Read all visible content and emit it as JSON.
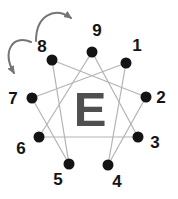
{
  "diagram": {
    "type": "enneagram",
    "center_letter": "E",
    "points": {
      "p1": {
        "label": "1"
      },
      "p2": {
        "label": "2"
      },
      "p3": {
        "label": "3"
      },
      "p4": {
        "label": "4"
      },
      "p5": {
        "label": "5"
      },
      "p6": {
        "label": "6"
      },
      "p7": {
        "label": "7"
      },
      "p8": {
        "label": "8"
      },
      "p9": {
        "label": "9"
      }
    },
    "connections": [
      "9-3",
      "3-6",
      "6-9",
      "1-4",
      "4-2",
      "2-8",
      "8-5",
      "5-7",
      "7-1"
    ],
    "arrows": [
      {
        "from": "8",
        "to": "9",
        "direction": "clockwise"
      },
      {
        "from": "8",
        "to": "7",
        "direction": "counterclockwise"
      }
    ]
  },
  "colors": {
    "bg-color": "#ffffff",
    "dot-color": "#141414",
    "number-color": "#141414",
    "line-color": "#b3b3b3",
    "letter-color": "#4f4f4f",
    "arrow-color": "#757575"
  }
}
